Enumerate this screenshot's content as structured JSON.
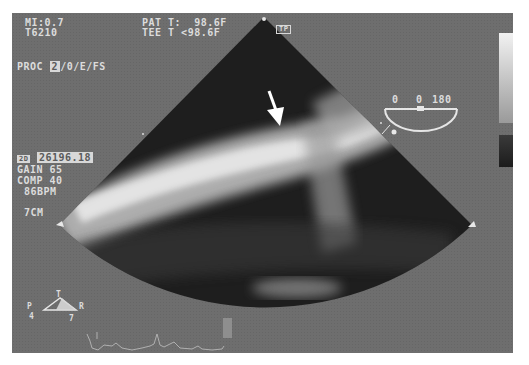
{
  "header_left": {
    "mi": "MI:0.7",
    "probe_id": "T6210",
    "proc_prefix": "PROC ",
    "proc_highlight": "2",
    "proc_suffix": "/0/E/FS"
  },
  "header_center": {
    "pat_temp": "PAT T:  98.6F",
    "tee_temp": "TEE T <98.6F"
  },
  "probe_icon_label": "TP",
  "protractor": {
    "left": "0",
    "mid": "0",
    "right": "180"
  },
  "side_panel": {
    "freq_icon": "2D",
    "freq_value": "26196.18",
    "gain": "GAIN 65",
    "comp": "COMP 40",
    "bpm": "86BPM",
    "depth": "7CM"
  },
  "orientation": {
    "top": "T",
    "left": "P",
    "right": "R",
    "bottom_left": "4",
    "bottom_right": "7"
  },
  "colors": {
    "screen_bg": "#6e6e6e",
    "overlay_text": "#dcdcdc",
    "ecg_trace": "#b0b0b0",
    "sector_dark": "#1e1e1e"
  }
}
